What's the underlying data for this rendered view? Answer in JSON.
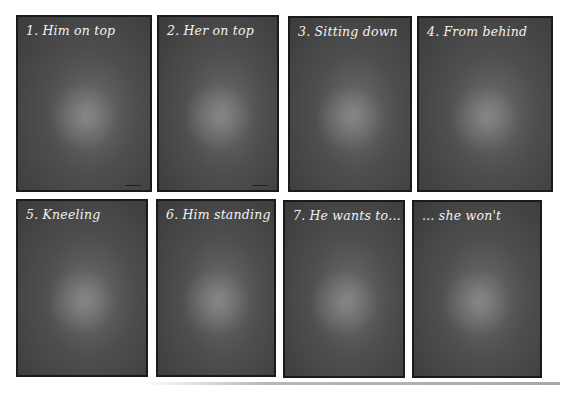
{
  "panels": [
    {
      "caption": "1.  Him on top"
    },
    {
      "caption": "2.  Her on top"
    },
    {
      "caption": "3.  Sitting down"
    },
    {
      "caption": "4.  From behind"
    },
    {
      "caption": "5.  Kneeling"
    },
    {
      "caption": "6.  Him standing"
    },
    {
      "caption": "7.  He wants to…"
    },
    {
      "caption": "… she won't"
    }
  ],
  "colors": {
    "panel_background": "#4e4e4e",
    "panel_border": "#1a1a1a",
    "caption_text": "#f2f2f2",
    "page_background": "#ffffff"
  }
}
